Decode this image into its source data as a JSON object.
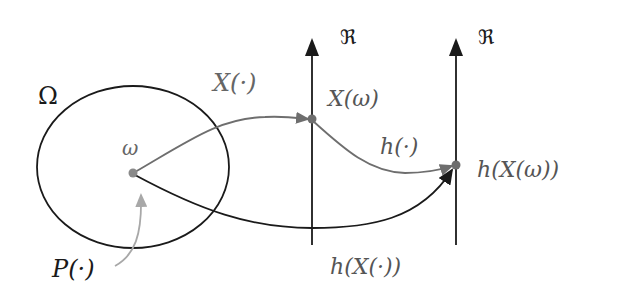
{
  "diagram": {
    "type": "random-variable-mapping",
    "colors": {
      "black": "#1a1a1a",
      "gray_curve": "#6e6e6e",
      "light_gray_arrow": "#a8a8a8",
      "label_gray": "#555555",
      "point": "#7a7a7a"
    },
    "sample_space": {
      "label": "Ω",
      "point_label": "ω",
      "measure_label": "P(·)"
    },
    "axes": [
      {
        "id": "axis-1",
        "label": "ℜ",
        "point_label": "X(ω)"
      },
      {
        "id": "axis-2",
        "label": "ℜ",
        "point_label": "h(X(ω))"
      }
    ],
    "mappings": [
      {
        "id": "map-X",
        "label": "X(·)",
        "from": "ω",
        "to": "X(ω)"
      },
      {
        "id": "map-h",
        "label": "h(·)",
        "from": "X(ω)",
        "to": "h(X(ω))"
      },
      {
        "id": "map-hX",
        "label": "h(X(·))",
        "from": "ω",
        "to": "h(X(ω))"
      }
    ]
  }
}
